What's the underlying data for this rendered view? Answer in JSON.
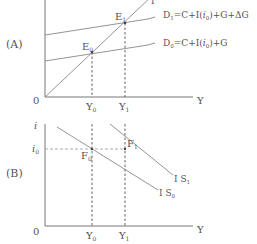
{
  "panelA": {
    "label": "(A)",
    "origin": "0",
    "x_axis_label": "Y",
    "line45_label": "I",
    "D1_label_main": "D",
    "D1_sub": "1",
    "D1_eq": "=C+I(",
    "D1_i": "i",
    "D1_i_sub": "0",
    "D1_eq_tail": ")+G+ΔG",
    "D0_label_main": "D",
    "D0_sub": "0",
    "D0_eq": "=C+I(",
    "D0_i": "i",
    "D0_i_sub": "0",
    "D0_eq_tail": ")+G",
    "E0": "E",
    "E0_sub": "0",
    "E1": "E",
    "E1_sub": "1",
    "Y0": "Y",
    "Y0_sub": "0",
    "Y1": "Y",
    "Y1_sub": "1"
  },
  "panelB": {
    "label": "(B)",
    "origin": "0",
    "y_axis_label": "i",
    "x_axis_label": "Y",
    "i0": "i",
    "i0_sub": "0",
    "F0": "F",
    "F0_sub": "0",
    "F1": "F",
    "F1_sub": "1",
    "IS1": "I S",
    "IS1_sub": "1",
    "IS0": "I S",
    "IS0_sub": "0",
    "Y0": "Y",
    "Y0_sub": "0",
    "Y1": "Y",
    "Y1_sub": "1"
  }
}
